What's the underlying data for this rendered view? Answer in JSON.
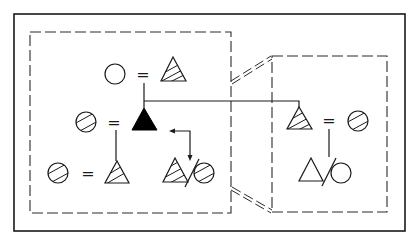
{
  "diagram": {
    "type": "kinship-genogram",
    "colors": {
      "ink": "#1a1a1a",
      "background": "#ffffff",
      "filled": "#000000"
    },
    "legend_symbols": {
      "triangle": "male",
      "circle": "female",
      "equals": "marriage",
      "slash": "divorce/separation",
      "hatched": "related individual",
      "filled": "ego"
    },
    "groups": [
      {
        "id": "left-household",
        "members": [
          {
            "id": "gm-top",
            "shape": "circle",
            "fill": "empty"
          },
          {
            "id": "gf-top",
            "shape": "triangle",
            "fill": "hatched"
          },
          {
            "id": "wife-mid",
            "shape": "circle",
            "fill": "hatched"
          },
          {
            "id": "ego",
            "shape": "triangle",
            "fill": "solid"
          },
          {
            "id": "wife-bottom",
            "shape": "circle",
            "fill": "hatched"
          },
          {
            "id": "son-bottom",
            "shape": "triangle",
            "fill": "hatched"
          },
          {
            "id": "divorced-male",
            "shape": "triangle",
            "fill": "hatched"
          },
          {
            "id": "divorced-female",
            "shape": "circle",
            "fill": "hatched"
          }
        ]
      },
      {
        "id": "right-household",
        "members": [
          {
            "id": "brother",
            "shape": "triangle",
            "fill": "hatched"
          },
          {
            "id": "brother-wife",
            "shape": "circle",
            "fill": "hatched"
          },
          {
            "id": "nephew",
            "shape": "triangle",
            "fill": "empty"
          },
          {
            "id": "nephew-ex",
            "shape": "circle",
            "fill": "empty"
          }
        ]
      }
    ],
    "relations": [
      {
        "type": "marriage",
        "label": "=",
        "between": [
          "gm-top",
          "gf-top"
        ]
      },
      {
        "type": "marriage",
        "label": "=",
        "between": [
          "wife-mid",
          "ego"
        ]
      },
      {
        "type": "marriage",
        "label": "=",
        "between": [
          "wife-bottom",
          "son-bottom"
        ]
      },
      {
        "type": "marriage",
        "label": "=",
        "between": [
          "brother",
          "brother-wife"
        ]
      },
      {
        "type": "divorce",
        "between": [
          "divorced-male",
          "divorced-female"
        ]
      },
      {
        "type": "divorce",
        "between": [
          "nephew",
          "nephew-ex"
        ]
      },
      {
        "type": "descent",
        "from": "gm-top+gf-top",
        "to": [
          "ego",
          "brother"
        ]
      },
      {
        "type": "descent",
        "from": "wife-mid+ego",
        "to": [
          "son-bottom"
        ]
      },
      {
        "type": "descent",
        "from": "brother+brother-wife",
        "to": [
          "nephew"
        ]
      },
      {
        "type": "reference-arrow",
        "from": "ego",
        "to": "divorced-male+divorced-female"
      }
    ],
    "equals_sign": "="
  }
}
